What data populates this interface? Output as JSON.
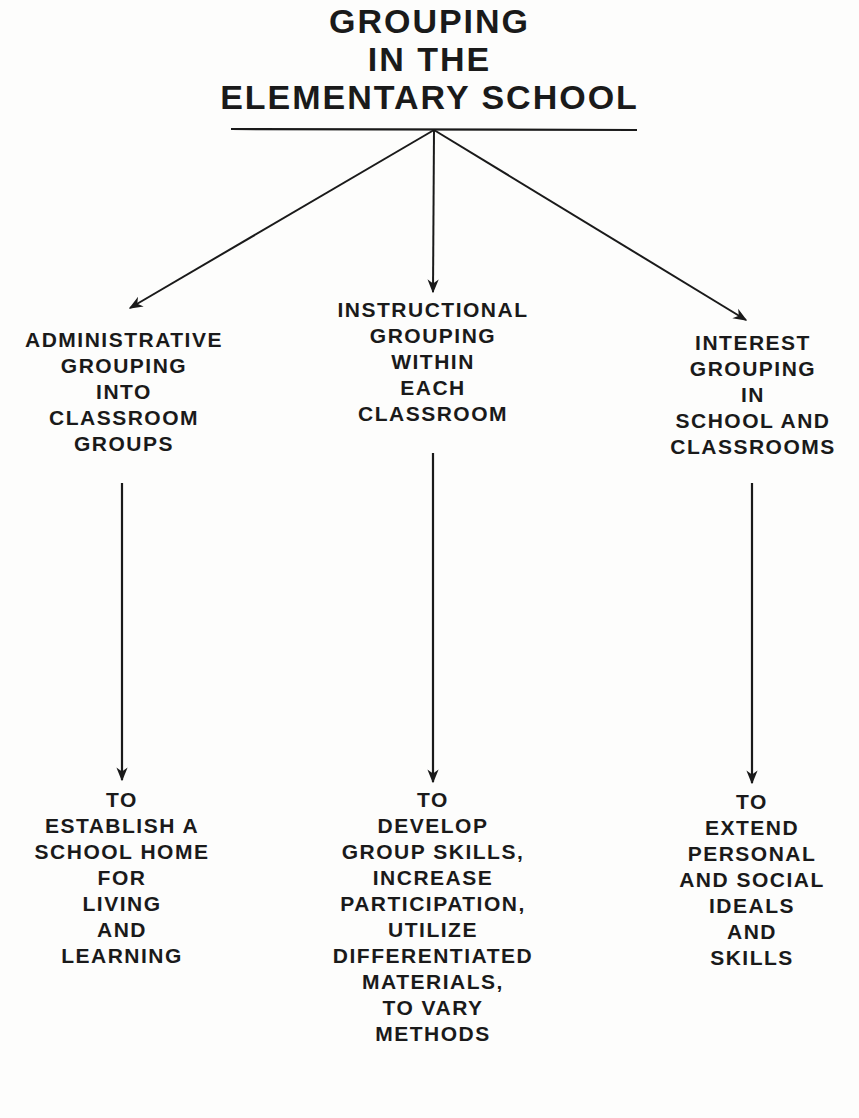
{
  "title": {
    "lines": [
      "GROUPING",
      "IN THE",
      "ELEMENTARY SCHOOL"
    ]
  },
  "categories": [
    {
      "id": "administrative",
      "lines": [
        "ADMINISTRATIVE",
        "GROUPING",
        "INTO",
        "CLASSROOM",
        "GROUPS"
      ]
    },
    {
      "id": "instructional",
      "lines": [
        "INSTRUCTIONAL",
        "GROUPING",
        "WITHIN",
        "EACH",
        "CLASSROOM"
      ]
    },
    {
      "id": "interest",
      "lines": [
        "INTEREST",
        "GROUPING",
        "IN",
        "SCHOOL AND",
        "CLASSROOMS"
      ]
    }
  ],
  "purposes": [
    {
      "id": "administrative-purpose",
      "lines": [
        "TO",
        "ESTABLISH A",
        "SCHOOL HOME",
        "FOR",
        "LIVING",
        "AND",
        "LEARNING"
      ]
    },
    {
      "id": "instructional-purpose",
      "lines": [
        "TO",
        "DEVELOP",
        "GROUP SKILLS,",
        "INCREASE",
        "PARTICIPATION,",
        "UTILIZE",
        "DIFFERENTIATED",
        "MATERIALS,",
        "TO VARY",
        "METHODS"
      ]
    },
    {
      "id": "interest-purpose",
      "lines": [
        "TO",
        "EXTEND",
        "PERSONAL",
        "AND SOCIAL",
        "IDEALS",
        "AND",
        "SKILLS"
      ]
    }
  ],
  "colors": {
    "ink": "#1a1a1a",
    "paper": "#fdfdfc"
  }
}
